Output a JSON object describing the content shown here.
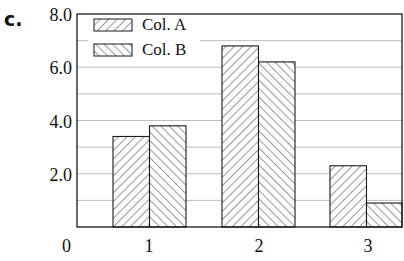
{
  "panel_label": "c.",
  "chart_data": {
    "type": "bar",
    "title": "",
    "xlabel": "",
    "ylabel": "",
    "categories": [
      "1",
      "2",
      "3"
    ],
    "series": [
      {
        "name": "Col. A",
        "pattern": "hatch-forward",
        "values": [
          3.4,
          6.8,
          2.3
        ]
      },
      {
        "name": "Col. B",
        "pattern": "hatch-back",
        "values": [
          3.8,
          6.2,
          0.9
        ]
      }
    ],
    "ylim": [
      0,
      8.0
    ],
    "y_tick_labels": [
      "0",
      "2.0",
      "4.0",
      "6.0",
      "8.0"
    ],
    "y_tick_values": [
      0,
      2,
      4,
      6,
      8
    ],
    "grid": {
      "horizontal": true,
      "interval": 1.0
    },
    "legend": {
      "position": "upper-left",
      "entries": [
        "Col. A",
        "Col. B"
      ]
    },
    "colors": {
      "bar_fill": "#ffffff",
      "hatch": "#333333",
      "outline": "#1a1a1a",
      "grid": "#bdbdbd"
    }
  }
}
